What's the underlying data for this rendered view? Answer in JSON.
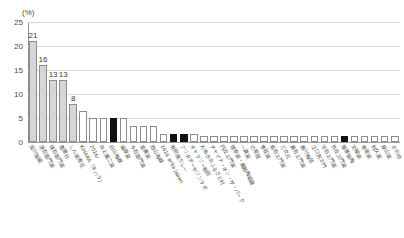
{
  "chart_data": {
    "type": "bar",
    "title": "",
    "subtitle": "",
    "xlabel": "",
    "ylabel": "",
    "unit_label": "(%)",
    "ylim": [
      0,
      25
    ],
    "yticks": [
      0,
      5,
      10,
      15,
      20,
      25
    ],
    "ytick_labels": [
      "0",
      "5",
      "10",
      "15",
      "20",
      "25"
    ],
    "grid": true,
    "legend": "none",
    "categories": [
      "深川製磁",
      "源右衛門窯",
      "柿右衛門窯",
      "香蘭社",
      "しん窯青花",
      "KIHARA（キハラ）",
      "2016/",
      "井上萬二窯",
      "白山陶器",
      "福泉窯",
      "今右衛門窯",
      "金善窯",
      "西山陶器",
      "1616 arita japan",
      "有田焼カレー",
      "アリタポーセリンラボ",
      "ギャラリー有田",
      "たぬきのふるさと村",
      "チャイナ・オン・ザ・パーク",
      "円左エ門窯",
      "徳幸窯・親和陶磁器",
      "一真窯",
      "辻常陸",
      "李荘窯",
      "岩右エ門窯",
      "三次元",
      "真右エ門窯",
      "奥川陶苑",
      "江口芳ヱ門",
      "宗右エ門窯",
      "弥左ヱ門窯",
      "藤巻製陶",
      "文翔窯",
      "幸楽窯",
      "利久窯",
      "泉山窯",
      "その他"
    ],
    "values": [
      21,
      16,
      13,
      13,
      8,
      6.5,
      5,
      5,
      5,
      5,
      3.3,
      3.3,
      3.3,
      1.7,
      1.7,
      1.7,
      1.7,
      1.2,
      1.2,
      1.2,
      1.2,
      1.2,
      1.2,
      1.2,
      1.2,
      1.2,
      1.2,
      1.2,
      1.2,
      1.2,
      1.2,
      1.2,
      1.2,
      1.2,
      1.2,
      1.2,
      1.2
    ],
    "bar_styles": [
      "gray",
      "gray",
      "gray",
      "gray",
      "gray",
      "white",
      "white",
      "white",
      "black",
      "white",
      "white",
      "white",
      "white",
      "white",
      "black",
      "black",
      "white",
      "white",
      "white",
      "white",
      "white",
      "white",
      "white",
      "white",
      "white",
      "white",
      "white",
      "white",
      "white",
      "white",
      "white",
      "black",
      "white",
      "white",
      "white",
      "white",
      "white"
    ],
    "value_labels": [
      "21",
      "16",
      "13",
      "13",
      "8",
      "",
      "",
      "",
      "",
      "",
      "",
      "",
      "",
      "",
      "",
      "",
      "",
      "",
      "",
      "",
      "",
      "",
      "",
      "",
      "",
      "",
      "",
      "",
      "",
      "",
      "",
      "",
      "",
      "",
      "",
      "",
      ""
    ],
    "colors": {
      "bar_gray": "#d6d6d6",
      "bar_white": "#ffffff",
      "bar_black": "#111111",
      "bar_border": "#8c8c8c",
      "gridline": "#d9d9d9",
      "axis": "#8d8d8d",
      "text": "#4a4a4a"
    }
  }
}
